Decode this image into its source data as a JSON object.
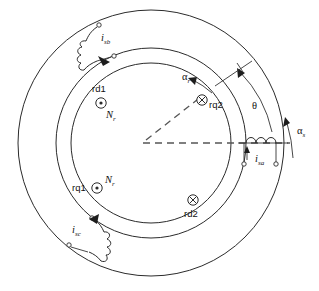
{
  "figure": {
    "kind": "machine-cross-section-diagram",
    "colors": {
      "line": "#2b2b2b",
      "dashed_axis": "#555555",
      "background": "#ffffff",
      "text": "#111111"
    }
  },
  "geometry": {
    "center_x": 151,
    "center_y": 143,
    "outer_radius": 133,
    "middle_radius": 95,
    "inner_radius": 92,
    "rotor_axis_angle_deg": 57
  },
  "stator_windings": [
    {
      "id": "isa",
      "symbol": "i",
      "subscript": "sa",
      "label": "i_sa",
      "position": "right",
      "angle_deg": 0
    },
    {
      "id": "isb",
      "symbol": "i",
      "subscript": "sb",
      "label": "i_sb",
      "position": "upper-left",
      "angle_deg": 120
    },
    {
      "id": "isc",
      "symbol": "i",
      "subscript": "sc",
      "label": "i_sc",
      "position": "lower-left",
      "angle_deg": 240
    }
  ],
  "rotor_conductors": [
    {
      "id": "rd1",
      "label": "rd1",
      "current_direction": "out-of-page",
      "marker": "dot-in-circle",
      "turns_label": "N",
      "turns_subscript": "r"
    },
    {
      "id": "rq2",
      "label": "rq2",
      "current_direction": "into-page",
      "marker": "cross-in-circle",
      "turns_label": "",
      "turns_subscript": ""
    },
    {
      "id": "rq1",
      "label": "rq1",
      "current_direction": "out-of-page",
      "marker": "dot-in-circle",
      "turns_label": "N",
      "turns_subscript": "r"
    },
    {
      "id": "rd2",
      "label": "rd2",
      "current_direction": "into-page",
      "marker": "cross-in-circle",
      "turns_label": "",
      "turns_subscript": ""
    }
  ],
  "angles": [
    {
      "id": "theta",
      "label": "θ",
      "subscript": "",
      "description": "rotor position angle between stator reference and rotor axis"
    },
    {
      "id": "alpha_r",
      "label": "α",
      "subscript": "r",
      "description": "rotor angular coordinate, counterclockwise"
    },
    {
      "id": "alpha_s",
      "label": "α",
      "subscript": "s",
      "description": "stator angular coordinate, counterclockwise"
    }
  ],
  "turns_labels": [
    {
      "id": "nr-top",
      "symbol": "N",
      "subscript": "r"
    },
    {
      "id": "nr-bottom",
      "symbol": "N",
      "subscript": "r"
    }
  ],
  "axes": [
    {
      "id": "stator-reference-axis",
      "style": "dashed",
      "direction": "horizontal-right"
    },
    {
      "id": "rotor-axis",
      "style": "dashed",
      "direction": "upper-right-57deg"
    }
  ]
}
